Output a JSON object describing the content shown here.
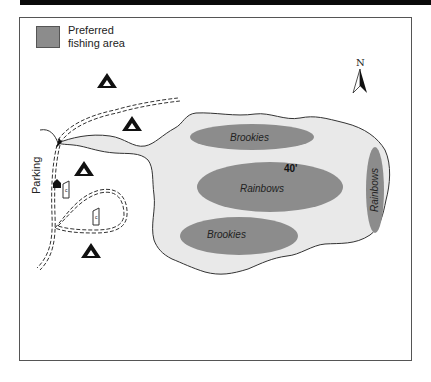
{
  "legend": {
    "line1": "Preferred",
    "line2": "fishing area",
    "swatch_color": "#8c8c8c"
  },
  "compass": {
    "label": "N"
  },
  "lake": {
    "fill": "#e9e9e9",
    "outline": "#333333",
    "depth_label": "40'"
  },
  "fishing_areas": [
    {
      "name": "Brookies",
      "position": "top"
    },
    {
      "name": "Rainbows",
      "position": "center"
    },
    {
      "name": "Brookies",
      "position": "bottom"
    },
    {
      "name": "Rainbows",
      "position": "right",
      "rotated": true
    }
  ],
  "labels": {
    "parking": "Parking"
  },
  "symbols": {
    "campsites": 4,
    "outhouses": 2,
    "trailhead_marker": 1
  },
  "colors": {
    "fishing_area": "#8c8c8c",
    "frame": "#555555",
    "topbar": "#0a0a0a"
  }
}
